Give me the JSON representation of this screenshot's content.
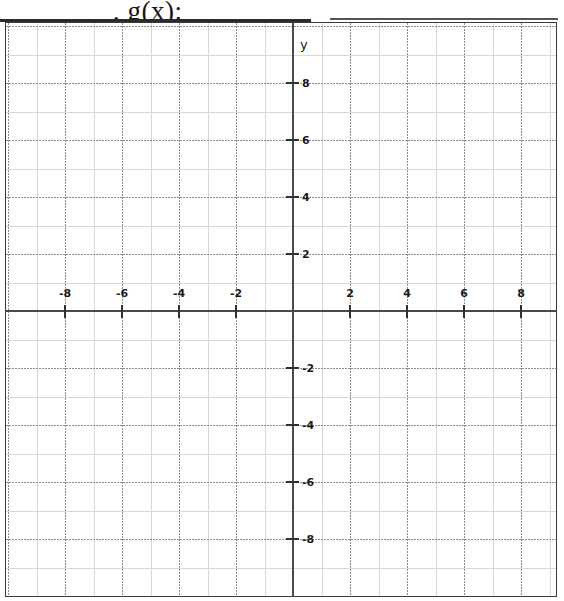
{
  "header": {
    "fragment_text": ", g(x):"
  },
  "graph": {
    "x_axis_label": "x",
    "y_axis_label": "y",
    "x_tick_labels": [
      "-8",
      "-6",
      "-4",
      "-2",
      "2",
      "4",
      "6",
      "8"
    ],
    "y_tick_labels": [
      "8",
      "6",
      "4",
      "2",
      "-2",
      "-4",
      "-6",
      "-8"
    ],
    "colors": {
      "grid_minor": "#d8d8d8",
      "grid_major": "#8d8d8d",
      "axis": "#4a4a4a",
      "border": "#3a3a3a",
      "text": "#1a1a1a"
    }
  },
  "chart_data": {
    "type": "scatter",
    "title": "",
    "subtitle": "",
    "xlabel": "x",
    "ylabel": "y",
    "xlim": [
      -10.2,
      9.3
    ],
    "ylim": [
      -10.1,
      10.1
    ],
    "x_ticks": [
      -8,
      -6,
      -4,
      -2,
      2,
      4,
      6,
      8
    ],
    "y_ticks": [
      8,
      6,
      4,
      2,
      -2,
      -4,
      -6,
      -8
    ],
    "x_tick_labels": [
      "-8",
      "-6",
      "-4",
      "-2",
      "2",
      "4",
      "6",
      "8"
    ],
    "y_tick_labels": [
      "8",
      "6",
      "4",
      "2",
      "-2",
      "-4",
      "-6",
      "-8"
    ],
    "minor_tick_step": 1,
    "major_tick_step": 2,
    "grid": true,
    "grid_minor_style": "solid",
    "grid_major_style": "dotted",
    "legend": false,
    "legend_position": "none",
    "series": [],
    "values": [],
    "annotations": [],
    "note": "Empty blank coordinate plane worksheet grid; no data plotted."
  }
}
